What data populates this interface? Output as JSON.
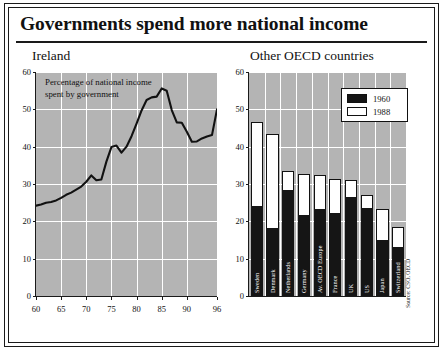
{
  "title": "Governments spend more national income",
  "source_note": "Source: CSO, OECD",
  "left_panel": {
    "title": "Ireland",
    "annotation_line1": "Percentage of national income",
    "annotation_line2": "spent by government"
  },
  "right_panel": {
    "title": "Other OECD countries",
    "legend": [
      {
        "label": "1960",
        "color": "#151515"
      },
      {
        "label": "1988",
        "color": "#ffffff"
      }
    ]
  },
  "chart_data": [
    {
      "type": "line",
      "title": "Ireland",
      "subtitle": "Percentage of national income spent by government",
      "xlabel": "",
      "ylabel": "",
      "xlim": [
        60,
        96
      ],
      "ylim": [
        0,
        60
      ],
      "yticks": [
        0,
        10,
        20,
        30,
        40,
        50,
        60
      ],
      "xticks": [
        60,
        65,
        70,
        75,
        80,
        85,
        90,
        96
      ],
      "grid": true,
      "legend_position": "none",
      "series": [
        {
          "name": "Ireland government spending (% of national income)",
          "x": [
            60,
            61,
            62,
            63,
            64,
            65,
            66,
            67,
            68,
            69,
            70,
            71,
            72,
            73,
            74,
            75,
            76,
            77,
            78,
            79,
            80,
            81,
            82,
            83,
            84,
            85,
            86,
            87,
            88,
            89,
            90,
            91,
            92,
            93,
            94,
            95,
            96
          ],
          "values": [
            24.2,
            24.5,
            25.0,
            25.2,
            25.6,
            26.3,
            27.1,
            27.7,
            28.5,
            29.3,
            30.6,
            32.3,
            31.0,
            31.2,
            36.0,
            39.9,
            40.3,
            38.4,
            40.0,
            42.8,
            46.2,
            49.7,
            52.5,
            53.2,
            53.4,
            55.6,
            55.0,
            49.8,
            46.5,
            46.4,
            44.0,
            41.3,
            41.4,
            42.2,
            42.7,
            43.1,
            50.0
          ]
        }
      ]
    },
    {
      "type": "bar",
      "title": "Other OECD countries",
      "subtitle": "Government spending as % of national income",
      "xlabel": "",
      "ylabel": "",
      "ylim": [
        0,
        60
      ],
      "yticks": [
        0,
        10,
        20,
        30,
        40,
        50,
        60
      ],
      "grid": true,
      "legend_position": "top-right",
      "categories": [
        "Sweden",
        "Denmark",
        "Netherlands",
        "Germany",
        "Av. OECD Europe",
        "France",
        "UK",
        "US",
        "Japan",
        "Switzerland"
      ],
      "series": [
        {
          "name": "1960",
          "values": [
            24.0,
            18.3,
            28.4,
            21.6,
            23.2,
            22.3,
            26.4,
            23.6,
            15.1,
            13.0
          ]
        },
        {
          "name": "1988",
          "values": [
            46.6,
            43.5,
            33.5,
            32.7,
            32.4,
            31.3,
            31.1,
            27.1,
            23.3,
            18.5
          ]
        }
      ]
    }
  ]
}
